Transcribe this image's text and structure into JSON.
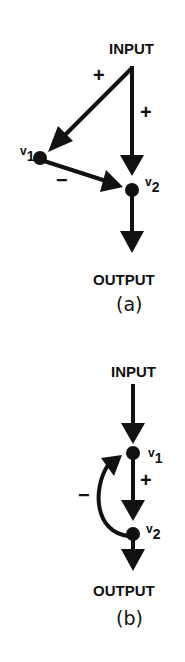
{
  "diagram_a": {
    "input_label": "INPUT",
    "output_label": "OUTPUT",
    "caption": "(a)",
    "node1": {
      "name": "v",
      "sub": "1"
    },
    "node2": {
      "name": "v",
      "sub": "2"
    },
    "edges": [
      {
        "from": "INPUT",
        "to": "v1",
        "sign": "+"
      },
      {
        "from": "INPUT",
        "to": "v2",
        "sign": "+"
      },
      {
        "from": "v1",
        "to": "v2",
        "sign": "−"
      },
      {
        "from": "v2",
        "to": "OUTPUT",
        "sign": ""
      }
    ],
    "sign_input_v1": "+",
    "sign_input_v2": "+",
    "sign_v1_v2": "−"
  },
  "diagram_b": {
    "input_label": "INPUT",
    "output_label": "OUTPUT",
    "caption": "(b)",
    "node1": {
      "name": "v",
      "sub": "1"
    },
    "node2": {
      "name": "v",
      "sub": "2"
    },
    "edges": [
      {
        "from": "INPUT",
        "to": "v1",
        "sign": ""
      },
      {
        "from": "v1",
        "to": "v2",
        "sign": "+"
      },
      {
        "from": "v2",
        "to": "v1",
        "sign": "−"
      },
      {
        "from": "v2",
        "to": "OUTPUT",
        "sign": ""
      }
    ],
    "sign_v1_v2": "+",
    "sign_v2_v1": "−"
  },
  "colors": {
    "ink": "#111111",
    "background": "#ffffff"
  }
}
